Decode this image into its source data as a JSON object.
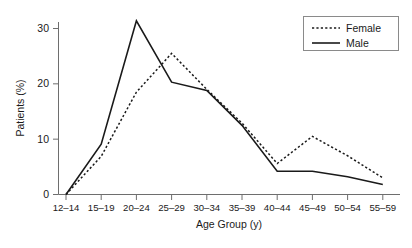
{
  "chart_data": {
    "type": "line",
    "title": "",
    "xlabel": "Age Group (y)",
    "ylabel": "Patients (%)",
    "categories": [
      "12–14",
      "15–19",
      "20–24",
      "25–29",
      "30–34",
      "35–39",
      "40–44",
      "45–49",
      "50–54",
      "55–59"
    ],
    "series": [
      {
        "name": "Female",
        "style": "dashed",
        "color": "#1a1a1a",
        "values": [
          0,
          6.9,
          18.5,
          25.5,
          19.0,
          12.9,
          5.6,
          10.5,
          7.0,
          3.0
        ]
      },
      {
        "name": "Male",
        "style": "solid",
        "color": "#1a1a1a",
        "values": [
          0,
          9.1,
          31.4,
          20.3,
          18.8,
          12.5,
          4.2,
          4.2,
          3.2,
          1.8
        ]
      }
    ],
    "ylim": [
      0,
      33
    ],
    "yticks": [
      0,
      10,
      20,
      30
    ],
    "ytick_labels": [
      "0",
      "10",
      "20",
      "30"
    ],
    "grid": false,
    "legend_position": "top-right"
  },
  "legend": {
    "entries": [
      {
        "label": "Female"
      },
      {
        "label": "Male"
      }
    ]
  },
  "axes": {
    "y_title": "Patients (%)",
    "x_title": "Age Group (y)"
  }
}
